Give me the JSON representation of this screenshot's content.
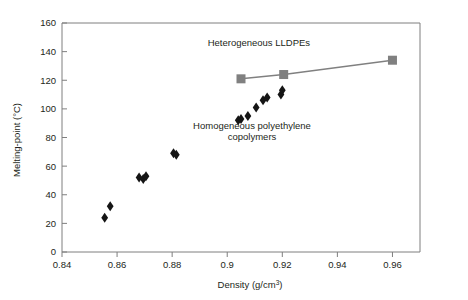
{
  "chart_data": {
    "type": "scatter",
    "title": "",
    "xlabel": "Density (g/cm3)",
    "xlabel_base": "Density (g/cm",
    "xlabel_sup": "3",
    "xlabel_close": ")",
    "ylabel": "Melting-point (°C)",
    "xlim": [
      0.84,
      0.97
    ],
    "ylim": [
      0,
      160
    ],
    "xticks": [
      0.84,
      0.86,
      0.88,
      0.9,
      0.92,
      0.94,
      0.96
    ],
    "xtick_labels": [
      "0.84",
      "0.86",
      "0.88",
      "0.9",
      "0.92",
      "0.94",
      "0.96"
    ],
    "yticks": [
      0,
      20,
      40,
      60,
      80,
      100,
      120,
      140,
      160
    ],
    "ytick_labels": [
      "0",
      "20",
      "40",
      "60",
      "80",
      "100",
      "120",
      "140",
      "160"
    ],
    "grid": false,
    "legend_position": "inline-annotations",
    "series": [
      {
        "name": "Homogeneous polyethylene copolymers",
        "marker": "diamond",
        "color": "#151515",
        "connected": false,
        "points": [
          {
            "x": 0.8555,
            "y": 24
          },
          {
            "x": 0.8575,
            "y": 32
          },
          {
            "x": 0.868,
            "y": 52
          },
          {
            "x": 0.8695,
            "y": 51
          },
          {
            "x": 0.8705,
            "y": 53
          },
          {
            "x": 0.8805,
            "y": 69
          },
          {
            "x": 0.8815,
            "y": 68
          },
          {
            "x": 0.904,
            "y": 92
          },
          {
            "x": 0.905,
            "y": 93
          },
          {
            "x": 0.9075,
            "y": 95
          },
          {
            "x": 0.9105,
            "y": 101
          },
          {
            "x": 0.913,
            "y": 106
          },
          {
            "x": 0.9145,
            "y": 108
          },
          {
            "x": 0.9195,
            "y": 110
          },
          {
            "x": 0.92,
            "y": 113
          }
        ]
      },
      {
        "name": "Heterogeneous LLDPEs",
        "marker": "square",
        "color": "#808080",
        "connected": true,
        "points": [
          {
            "x": 0.905,
            "y": 121
          },
          {
            "x": 0.9205,
            "y": 124
          },
          {
            "x": 0.96,
            "y": 134
          }
        ]
      }
    ],
    "annotations": [
      {
        "name": "heterogeneous-label",
        "text": "Heterogeneous LLDPEs",
        "x": 0.9115,
        "y": 144
      },
      {
        "name": "homogeneous-label-line1",
        "text": "Homogeneous polyethylene",
        "x": 0.909,
        "y": 86
      },
      {
        "name": "homogeneous-label-line2",
        "text": "copolymers",
        "x": 0.909,
        "y": 78
      }
    ]
  },
  "colors": {
    "axis": "#7f7f7f",
    "heterogeneous": "#808080",
    "homogeneous": "#151515",
    "text": "#231f20",
    "background": "#ffffff"
  }
}
